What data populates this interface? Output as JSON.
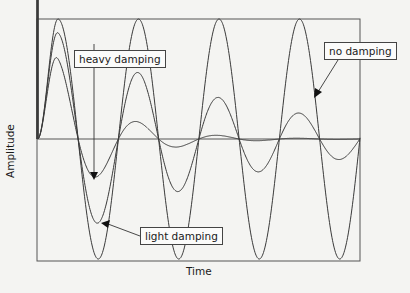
{
  "chart_data": {
    "type": "line",
    "title": "",
    "xlabel": "Time",
    "ylabel": "Amplitude",
    "x_ticks": [],
    "y_ticks": [],
    "grid": false,
    "legend": "annotations",
    "period_cycles_shown": 4,
    "ylim": [
      -1,
      1
    ],
    "series": [
      {
        "name": "no damping",
        "amplitude_envelope": [
          1.0,
          1.0,
          1.0,
          1.0,
          1.0,
          1.0,
          1.0,
          1.0
        ],
        "damping": 0.0
      },
      {
        "name": "light damping",
        "amplitude_envelope": [
          0.89,
          0.69,
          0.56,
          0.45,
          0.36,
          0.29,
          0.23,
          0.19
        ],
        "damping": 0.47
      },
      {
        "name": "heavy damping",
        "amplitude_envelope": [
          0.7,
          0.33,
          0.15,
          0.07,
          0.03,
          0.015,
          0.007,
          0.003
        ],
        "damping": 1.55
      }
    ],
    "annotations": [
      {
        "text": "heavy damping",
        "points_to": "heavy damping trough 1"
      },
      {
        "text": "light damping",
        "points_to": "light damping trough 1"
      },
      {
        "text": "no damping",
        "points_to": "no damping descending slope"
      }
    ]
  },
  "labels": {
    "heavy": "heavy damping",
    "light": "light damping",
    "none": "no damping",
    "x": "Time",
    "y": "Amplitude"
  },
  "colors": {
    "line": "#3a3a3a",
    "background": "#f4f4f2"
  }
}
